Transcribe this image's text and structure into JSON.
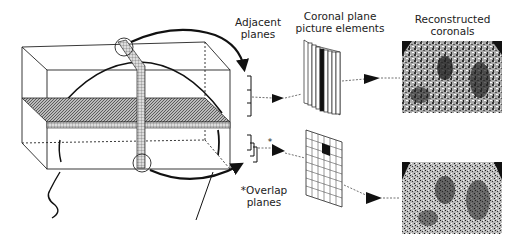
{
  "labels": {
    "adjacent_planes_line1": "Adjacent",
    "adjacent_planes_line2": "planes",
    "coronal_plane_line1": "Coronal plane",
    "coronal_plane_line2": "picture elements",
    "reconstructed_line1": "Reconstructed",
    "reconstructed_line2": "coronals",
    "overlap_line1": "*Overlap",
    "overlap_line2": "planes",
    "overlap_marker": "*"
  }
}
